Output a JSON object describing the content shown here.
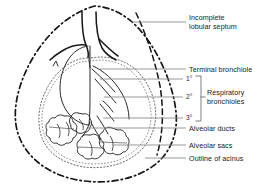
{
  "figure": {
    "kind": "anatomical-line-diagram",
    "ink_color": "#1a1a1a",
    "background_color": "#ffffff",
    "leader_line_color": "#8a8a8a"
  },
  "labels": {
    "incomplete_lobular_septum": "Incomplete\nlobular septum",
    "incomplete_lobular_septum_line1": "Incomplete",
    "incomplete_lobular_septum_line2": "lobular septum",
    "terminal_bronchiole": "Terminal bronchiole",
    "respiratory_bronchioles_line1": "Respiratory",
    "respiratory_bronchioles_line2": "bronchioles",
    "alveolar_ducts": "Alveolar ducts",
    "alveolar_sacs": "Alveolar sacs",
    "outline_of_acinus": "Outline of acinus"
  },
  "order_markers": [
    {
      "id": "first-order",
      "text": "1°"
    },
    {
      "id": "second-order",
      "text": "2°"
    },
    {
      "id": "third-order",
      "text": "3°"
    }
  ]
}
